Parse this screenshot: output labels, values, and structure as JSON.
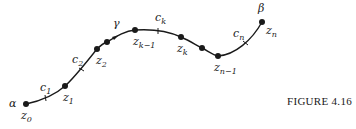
{
  "figure": {
    "caption": "FIGURE 4.16",
    "curve_label": "γ",
    "start_label": "α",
    "end_label": "β",
    "points": [
      {
        "name": "z",
        "sub": "0",
        "x": 26,
        "y": 104,
        "lx": 21,
        "ly": 119
      },
      {
        "name": "z",
        "sub": "1",
        "x": 65,
        "y": 86,
        "lx": 63,
        "ly": 101
      },
      {
        "name": "z",
        "sub": "2",
        "x": 97,
        "y": 49,
        "lx": 96,
        "ly": 64
      },
      {
        "name": "",
        "sub": "",
        "x": 107,
        "y": 42,
        "lx": 0,
        "ly": 0
      },
      {
        "name": "z",
        "sub": "k−1",
        "x": 135,
        "y": 30,
        "lx": 133,
        "ly": 46
      },
      {
        "name": "z",
        "sub": "k",
        "x": 181,
        "y": 37,
        "lx": 178,
        "ly": 52
      },
      {
        "name": "",
        "sub": "",
        "x": 202,
        "y": 48,
        "lx": 0,
        "ly": 0
      },
      {
        "name": "z",
        "sub": "n−1",
        "x": 218,
        "y": 56,
        "lx": 215,
        "ly": 72
      },
      {
        "name": "z",
        "sub": "n",
        "x": 262,
        "y": 22,
        "lx": 265,
        "ly": 34
      }
    ],
    "arc_labels": [
      {
        "name": "c",
        "sub": "1",
        "x": 40,
        "y": 91
      },
      {
        "name": "c",
        "sub": "2",
        "x": 72,
        "y": 63
      },
      {
        "name": "c",
        "sub": "k",
        "x": 155,
        "y": 21
      },
      {
        "name": "c",
        "sub": "n",
        "x": 233,
        "y": 37
      }
    ]
  }
}
